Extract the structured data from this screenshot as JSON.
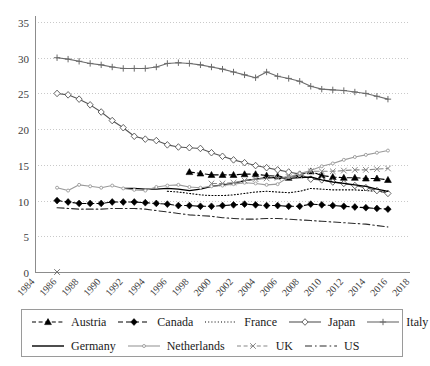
{
  "chart_data": {
    "type": "line",
    "title": "",
    "xlabel": "",
    "ylabel": "",
    "xlim": [
      1984,
      2018
    ],
    "ylim": [
      0,
      35
    ],
    "ytick_step": 5,
    "xtick_step": 2,
    "grid": true,
    "legend_position": "bottom",
    "yticks": [
      "0",
      "5",
      "10",
      "15",
      "20",
      "25",
      "30",
      "35"
    ],
    "xticks": [
      "1984",
      "1986",
      "1988",
      "1990",
      "1992",
      "1994",
      "1996",
      "1998",
      "2000",
      "2002",
      "2004",
      "2006",
      "2008",
      "2010",
      "2012",
      "2014",
      "2016",
      "2018"
    ],
    "series": [
      {
        "name": "Austria",
        "style": "dashed",
        "marker": "triangle",
        "color": "#000000",
        "x": [
          1998,
          1999,
          2000,
          2001,
          2002,
          2003,
          2004,
          2005,
          2006,
          2007,
          2008,
          2009,
          2010,
          2011,
          2012,
          2013,
          2014,
          2015,
          2016
        ],
        "values": [
          14.0,
          13.8,
          13.6,
          13.6,
          13.6,
          13.7,
          13.7,
          13.5,
          13.4,
          13.2,
          13.6,
          14.1,
          13.5,
          13.3,
          13.2,
          13.2,
          13.1,
          13.1,
          12.9
        ]
      },
      {
        "name": "Canada",
        "style": "dashed",
        "marker": "diamond",
        "color": "#000000",
        "x": [
          1986,
          1987,
          1988,
          1989,
          1990,
          1991,
          1992,
          1993,
          1994,
          1995,
          1996,
          1997,
          1998,
          1999,
          2000,
          2001,
          2002,
          2003,
          2004,
          2005,
          2006,
          2007,
          2008,
          2009,
          2010,
          2011,
          2012,
          2013,
          2014,
          2015,
          2016
        ],
        "values": [
          10.0,
          9.8,
          9.6,
          9.6,
          9.6,
          9.8,
          9.8,
          9.8,
          9.7,
          9.6,
          9.5,
          9.3,
          9.3,
          9.2,
          9.2,
          9.3,
          9.4,
          9.5,
          9.4,
          9.3,
          9.3,
          9.2,
          9.2,
          9.5,
          9.4,
          9.3,
          9.2,
          9.1,
          9.0,
          8.9,
          8.8
        ]
      },
      {
        "name": "France",
        "style": "dotted",
        "marker": "none",
        "color": "#000000",
        "x": [
          1996,
          1997,
          1998,
          1999,
          2000,
          2001,
          2002,
          2003,
          2004,
          2005,
          2006,
          2007,
          2008,
          2009,
          2010,
          2011,
          2012,
          2013,
          2014,
          2015,
          2016
        ],
        "values": [
          11.3,
          11.2,
          11.0,
          10.8,
          10.7,
          10.7,
          10.8,
          11.0,
          11.2,
          11.3,
          11.2,
          11.1,
          11.3,
          11.7,
          11.6,
          11.5,
          11.5,
          11.5,
          11.4,
          11.3,
          11.2
        ]
      },
      {
        "name": "Japan",
        "style": "solid",
        "marker": "open-diamond",
        "color": "#555555",
        "x": [
          1986,
          1987,
          1988,
          1989,
          1990,
          1991,
          1992,
          1993,
          1994,
          1995,
          1996,
          1997,
          1998,
          1999,
          2000,
          2001,
          2002,
          2003,
          2004,
          2005,
          2006,
          2007,
          2008,
          2009,
          2010,
          2011,
          2012,
          2013,
          2014,
          2015,
          2016
        ],
        "values": [
          25.0,
          24.8,
          24.2,
          23.4,
          22.4,
          21.2,
          20.2,
          19.0,
          18.6,
          18.4,
          17.8,
          17.5,
          17.4,
          17.3,
          16.7,
          16.2,
          15.7,
          15.3,
          14.9,
          14.6,
          14.3,
          14.0,
          13.7,
          13.0,
          12.9,
          12.6,
          12.4,
          12.1,
          11.8,
          11.4,
          11.0
        ]
      },
      {
        "name": "Italy",
        "style": "solid",
        "marker": "plus",
        "color": "#6b6b6b",
        "x": [
          1986,
          1987,
          1988,
          1989,
          1990,
          1991,
          1992,
          1993,
          1994,
          1995,
          1996,
          1997,
          1998,
          1999,
          2000,
          2001,
          2002,
          2003,
          2004,
          2005,
          2006,
          2007,
          2008,
          2009,
          2010,
          2011,
          2012,
          2013,
          2014,
          2015,
          2016
        ],
        "values": [
          30.0,
          29.8,
          29.5,
          29.2,
          29.0,
          28.7,
          28.5,
          28.5,
          28.5,
          28.7,
          29.2,
          29.3,
          29.2,
          29.0,
          28.7,
          28.4,
          28.0,
          27.6,
          27.2,
          28.0,
          27.4,
          27.1,
          26.7,
          26.0,
          25.6,
          25.5,
          25.4,
          25.2,
          25.0,
          24.6,
          24.2
        ]
      },
      {
        "name": "Germany",
        "style": "solid",
        "marker": "none",
        "color": "#000000",
        "x": [
          1992,
          1993,
          1994,
          1995,
          1996,
          1997,
          1998,
          1999,
          2000,
          2001,
          2002,
          2003,
          2004,
          2005,
          2006,
          2007,
          2008,
          2009,
          2010,
          2011,
          2012,
          2013,
          2014,
          2015,
          2016
        ],
        "values": [
          11.7,
          11.7,
          11.6,
          11.6,
          11.7,
          11.6,
          11.4,
          11.6,
          12.0,
          12.2,
          12.4,
          12.8,
          13.0,
          13.2,
          13.2,
          13.1,
          13.2,
          13.3,
          12.9,
          12.6,
          12.4,
          12.2,
          12.0,
          11.6,
          11.3
        ]
      },
      {
        "name": "Netherlands",
        "style": "solid",
        "marker": "small-dot",
        "color": "#9a9a9a",
        "x": [
          1986,
          1987,
          1988,
          1989,
          1990,
          1991,
          1992,
          1993,
          1994,
          1995,
          1996,
          1997,
          1998,
          1999,
          2000,
          2001,
          2002,
          2003,
          2004,
          2005,
          2006,
          2007,
          2008,
          2009,
          2010,
          2011,
          2012,
          2013,
          2014,
          2015,
          2016
        ],
        "values": [
          11.8,
          11.4,
          12.2,
          12.0,
          11.8,
          12.1,
          11.7,
          11.5,
          11.4,
          11.9,
          12.1,
          12.2,
          11.9,
          11.8,
          12.0,
          12.1,
          12.3,
          12.5,
          12.4,
          12.2,
          12.3,
          13.3,
          13.8,
          14.2,
          14.8,
          15.2,
          15.7,
          16.1,
          16.4,
          16.7,
          17.0
        ]
      },
      {
        "name": "UK",
        "style": "dashed",
        "marker": "x",
        "color": "#888888",
        "x": [
          2000,
          2001,
          2002,
          2003,
          2004,
          2005,
          2006,
          2007,
          2008,
          2009,
          2010,
          2011,
          2012,
          2013,
          2014,
          2015,
          2016
        ],
        "values": [
          12.4,
          12.4,
          12.5,
          12.8,
          13.0,
          13.1,
          13.2,
          13.3,
          13.5,
          14.1,
          14.1,
          14.1,
          14.2,
          14.3,
          14.3,
          14.4,
          14.5
        ]
      },
      {
        "name": "US",
        "style": "dash-dot",
        "marker": "none",
        "color": "#2b2b2b",
        "x": [
          1986,
          1987,
          1988,
          1989,
          1990,
          1991,
          1992,
          1993,
          1994,
          1995,
          1996,
          1997,
          1998,
          1999,
          2000,
          2001,
          2002,
          2003,
          2004,
          2005,
          2006,
          2007,
          2008,
          2009,
          2010,
          2011,
          2012,
          2013,
          2014,
          2015,
          2016
        ],
        "values": [
          9.0,
          8.9,
          8.8,
          8.8,
          8.8,
          8.9,
          8.9,
          8.9,
          8.8,
          8.6,
          8.4,
          8.2,
          8.0,
          7.9,
          7.8,
          7.6,
          7.5,
          7.4,
          7.4,
          7.5,
          7.5,
          7.4,
          7.3,
          7.2,
          7.1,
          7.0,
          6.9,
          6.8,
          6.7,
          6.5,
          6.3
        ]
      }
    ]
  },
  "legend": {
    "rows": [
      [
        {
          "label": "Austria",
          "key": "dashed-triangle"
        },
        {
          "label": "Canada",
          "key": "dashed-diamond"
        },
        {
          "label": "France",
          "key": "dotted"
        },
        {
          "label": "Japan",
          "key": "line-open-diamond"
        },
        {
          "label": "Italy",
          "key": "line-plus"
        }
      ],
      [
        {
          "label": "Germany",
          "key": "solid"
        },
        {
          "label": "Netherlands",
          "key": "gray-line-dot"
        },
        {
          "label": "UK",
          "key": "dashed-x"
        },
        {
          "label": "US",
          "key": "dash-dot"
        }
      ]
    ]
  }
}
